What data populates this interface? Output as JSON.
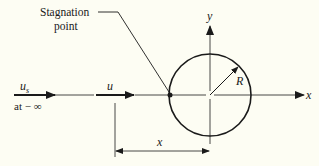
{
  "diagram": {
    "labels": {
      "stagnation_line1": "Stagnation",
      "stagnation_line2": "point",
      "free_stream_velocity": "u",
      "free_stream_subscript": "s",
      "free_stream_location": "at − ∞",
      "local_velocity": "u",
      "radius": "R",
      "x_axis": "x",
      "y_axis": "y",
      "distance": "x"
    },
    "colors": {
      "background": "#fdfdf3",
      "ink": "#1a1a1a"
    }
  }
}
